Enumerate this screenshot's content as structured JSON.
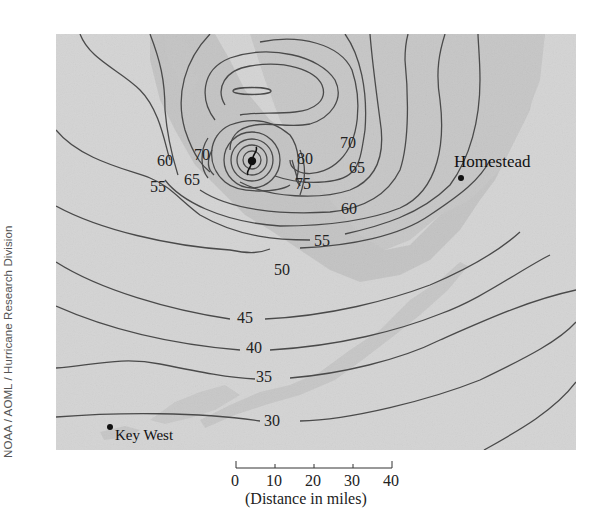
{
  "figure": {
    "type": "hurricane wind-speed contour map",
    "credit": "NOAA / AOML / Hurricane Research Division",
    "places": [
      {
        "name": "Homestead",
        "label": "Homestead"
      },
      {
        "name": "Key West",
        "label": "Key West"
      }
    ],
    "contour_labels": [
      "80",
      "75",
      "70",
      "70",
      "65",
      "65",
      "60",
      "60",
      "55",
      "55",
      "50",
      "45",
      "40",
      "35",
      "30"
    ],
    "labels": {
      "c60_left": "60",
      "c70_left": "70",
      "c55_left": "55",
      "c65_left": "65",
      "c80": "80",
      "c75": "75",
      "c70_right": "70",
      "c65_right": "65",
      "c60_right": "60",
      "c55_right": "55",
      "c50": "50",
      "c45": "45",
      "c40": "40",
      "c35": "35",
      "c30": "30"
    },
    "scale_bar": {
      "ticks": [
        "0",
        "10",
        "20",
        "30",
        "40"
      ],
      "caption": "(Distance in miles)"
    },
    "colors": {
      "sea": "#d4d4d4",
      "land": "#c2c2c2",
      "contour": "#4a4a4a",
      "text": "#222222"
    },
    "icons": [
      "hurricane-symbol-icon",
      "city-dot-icon"
    ]
  }
}
